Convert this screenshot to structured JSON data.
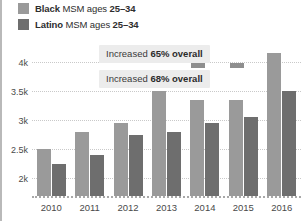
{
  "legend": {
    "items": [
      {
        "label_bold": "Black",
        "label_rest": " MSM ages ",
        "label_bold2": "25–34",
        "color": "#9a9a9a",
        "swatch_name": "legend-swatch-black-msm"
      },
      {
        "label_bold": "Latino",
        "label_rest": " MSM ages ",
        "label_bold2": "25–34",
        "color": "#6e6e6e",
        "swatch_name": "legend-swatch-latino-msm"
      }
    ]
  },
  "annotations": [
    {
      "prefix": "Increased ",
      "value": "65% overall"
    },
    {
      "prefix": "Increased ",
      "value": "68% overall"
    }
  ],
  "chart_data": {
    "type": "bar",
    "title": "",
    "xlabel": "",
    "ylabel": "",
    "categories": [
      "2010",
      "2011",
      "2012",
      "2013",
      "2014",
      "2015",
      "2016"
    ],
    "series": [
      {
        "name": "Black MSM ages 25–34",
        "color": "#9a9a9a",
        "values": [
          2500,
          2800,
          2950,
          3500,
          3350,
          3350,
          4150
        ]
      },
      {
        "name": "Latino MSM ages 25–34",
        "color": "#6e6e6e",
        "values": [
          2250,
          2400,
          2750,
          2800,
          2950,
          3050,
          3500
        ]
      }
    ],
    "ytick_labels": [
      "4k",
      "3.5k",
      "3k",
      "2.5k",
      "2k"
    ],
    "ytick_values": [
      4000,
      3500,
      3000,
      2500,
      2000
    ],
    "ylim": [
      1694,
      4290
    ],
    "grid": true,
    "legend_position": "top-left",
    "annotations_text": [
      "Increased 65% overall",
      "Increased 68% overall"
    ]
  }
}
